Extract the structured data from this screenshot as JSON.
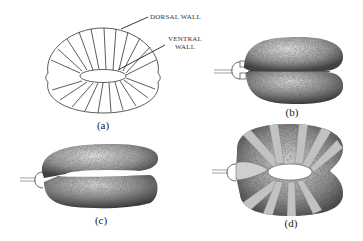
{
  "figure": {
    "panels": [
      {
        "id": "a",
        "label": "(a)",
        "description": "line drawing of toroidal balloon showing dorsal and ventral walls"
      },
      {
        "id": "b",
        "label": "(b)",
        "description": "shaded collapsed torus, side view with inlet tube"
      },
      {
        "id": "c",
        "label": "(c)",
        "description": "shaded partially inflated torus with inlet tube"
      },
      {
        "id": "d",
        "label": "(d)",
        "description": "shaded inflated torus wrapped with reinforcing bands, inlet tube"
      }
    ],
    "callouts": {
      "dorsal": "DORSAL WALL",
      "ventral_line1": "VENTRAL",
      "ventral_line2": "WALL"
    },
    "colors": {
      "stroke": "#333333",
      "shade_dark": "#5a5a5a",
      "shade_light": "#d8d8d8",
      "band": "#bdbdbd",
      "background": "#ffffff"
    }
  }
}
